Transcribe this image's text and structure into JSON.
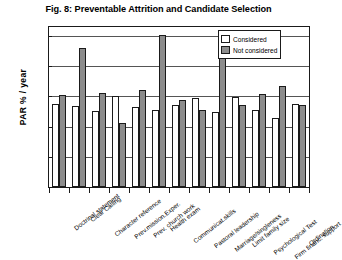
{
  "figure": {
    "title": "Fig. 8: Preventable Attrition and Candidate Selection"
  },
  "legend": {
    "position": "top-right",
    "entries": [
      {
        "label": "Considered",
        "color": "#ffffff",
        "key": "considered"
      },
      {
        "label": "Not considered",
        "color": "#8c8c8c",
        "key": "not_considered"
      }
    ]
  },
  "axes": {
    "y": {
      "title": "PAR  % / year",
      "ticks": [
        "0",
        "2",
        "4",
        "6",
        "8",
        "10"
      ],
      "min": 0,
      "max": 10.6
    }
  },
  "chart_data": {
    "type": "bar",
    "title": "Fig. 8: Preventable Attrition and Candidate Selection",
    "xlabel": "",
    "ylabel": "PAR  % / year",
    "ylim": [
      0,
      10.6
    ],
    "yticks": [
      0,
      2,
      4,
      6,
      8,
      10
    ],
    "grid": true,
    "grid_axis": "y",
    "legend": [
      "Considered",
      "Not considered"
    ],
    "legend_position": "upper right",
    "categories": [
      "Doctrinal statement",
      "Clear Calling",
      "Character reference",
      "Prev.mission.Exper.",
      "Prev. church work",
      "Health exam",
      "Communicat.skills",
      "Pastoral leadership",
      "Marriage/singleness",
      "Limit family size",
      "Psychological Test",
      "Firm financ. support",
      "Ordination"
    ],
    "series": [
      {
        "name": "Considered",
        "color": "#ffffff",
        "values": [
          5.5,
          5.35,
          5.05,
          6.05,
          5.3,
          5.1,
          5.45,
          5.9,
          5.0,
          5.95,
          5.1,
          4.6,
          5.5
        ]
      },
      {
        "name": "Not considered",
        "color": "#8c8c8c",
        "values": [
          6.1,
          9.2,
          6.25,
          4.25,
          6.4,
          10.05,
          5.75,
          5.1,
          8.7,
          5.45,
          6.15,
          6.7,
          5.45
        ]
      }
    ]
  }
}
